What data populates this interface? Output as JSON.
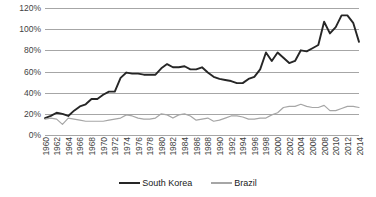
{
  "chart_data": {
    "type": "line",
    "title": "",
    "subtitle": "",
    "xlabel": "",
    "ylabel": "",
    "grid": true,
    "legend_position": "bottom",
    "xlim": [
      1960,
      2014
    ],
    "ylim": [
      0,
      120
    ],
    "y_ticks": [
      120,
      100,
      80,
      60,
      40,
      20,
      0
    ],
    "y_tick_labels": [
      "120%",
      "100%",
      "80%",
      "60%",
      "40%",
      "20%",
      "0%"
    ],
    "x": [
      1960,
      1961,
      1962,
      1963,
      1964,
      1965,
      1966,
      1967,
      1968,
      1969,
      1970,
      1971,
      1972,
      1973,
      1974,
      1975,
      1976,
      1977,
      1978,
      1979,
      1980,
      1981,
      1982,
      1983,
      1984,
      1985,
      1986,
      1987,
      1988,
      1989,
      1990,
      1991,
      1992,
      1993,
      1994,
      1995,
      1996,
      1997,
      1998,
      1999,
      2000,
      2001,
      2002,
      2003,
      2004,
      2005,
      2006,
      2007,
      2008,
      2009,
      2010,
      2011,
      2012,
      2013,
      2014
    ],
    "x_tick_labels": [
      "1960",
      "1962",
      "1964",
      "1966",
      "1968",
      "1970",
      "1972",
      "1974",
      "1976",
      "1978",
      "1980",
      "1982",
      "1984",
      "1986",
      "1988",
      "1990",
      "1992",
      "1994",
      "1996",
      "1998",
      "2000",
      "2002",
      "2004",
      "2006",
      "2008",
      "2010",
      "2012",
      "2014"
    ],
    "series": [
      {
        "name": "South Korea",
        "color": "#262626",
        "values": [
          16,
          18,
          21,
          20,
          18,
          23,
          27,
          29,
          34,
          34,
          38,
          41,
          41,
          54,
          59,
          58,
          58,
          57,
          57,
          57,
          63,
          67,
          64,
          64,
          65,
          62,
          62,
          64,
          59,
          55,
          53,
          52,
          51,
          49,
          49,
          53,
          55,
          62,
          78,
          70,
          78,
          73,
          68,
          70,
          80,
          79,
          82,
          85,
          107,
          96,
          102,
          113,
          113,
          106,
          88
        ]
      },
      {
        "name": "Brazil",
        "color": "#a6a6a6",
        "values": [
          15,
          16,
          15,
          10,
          16,
          15,
          14,
          13,
          13,
          13,
          13,
          14,
          15,
          16,
          19,
          18,
          16,
          15,
          15,
          16,
          20,
          19,
          16,
          19,
          20,
          18,
          14,
          15,
          16,
          13,
          14,
          16,
          18,
          18,
          17,
          15,
          15,
          16,
          16,
          19,
          21,
          26,
          27,
          27,
          29,
          27,
          26,
          26,
          28,
          23,
          23,
          25,
          27,
          27,
          26
        ]
      }
    ]
  },
  "legend": {
    "items": [
      {
        "label": "South Korea",
        "color": "#262626"
      },
      {
        "label": "Brazil",
        "color": "#a6a6a6"
      }
    ]
  },
  "colors": {
    "gridline": "#a6a6a6",
    "axis_text": "#3f3f3f",
    "background": "#ffffff"
  }
}
